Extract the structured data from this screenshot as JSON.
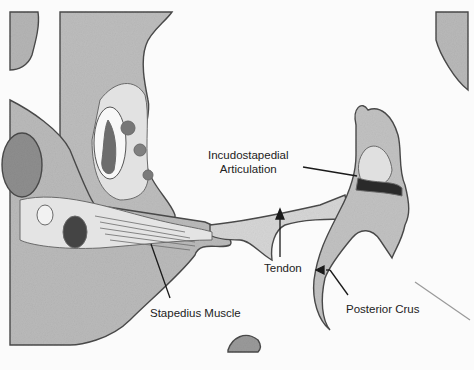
{
  "figure": {
    "labels": {
      "incudostapedial_line1": "Incudostapedial",
      "incudostapedial_line2": "Articulation",
      "tendon": "Tendon",
      "stapedius_muscle": "Stapedius Muscle",
      "posterior_crus": "Posterior Crus"
    },
    "colors": {
      "background": "#fbfbfb",
      "bone": "#b8b8b8",
      "bone_edge": "#4a4a4a",
      "soft_tissue": "#e4e4e4",
      "dark_tissue": "#5a5a5a",
      "label_text": "#222222"
    }
  }
}
